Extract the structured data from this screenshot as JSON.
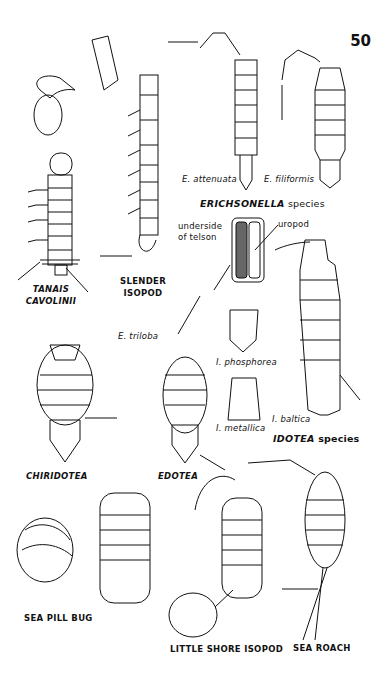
{
  "page_number": "50",
  "groups": {
    "erichsonella": {
      "title_genus": "ERICHSONELLA",
      "title_suffix": " species",
      "species": [
        {
          "name": "E. attenuata"
        },
        {
          "name": "E. filiformis"
        }
      ],
      "detail_labels": {
        "underside_line1": "underside",
        "underside_line2": "of telson",
        "uropod": "uropod"
      }
    },
    "idotea": {
      "title_genus": "IDOTEA",
      "title_suffix": " species",
      "species": [
        {
          "name": "I. phosphorea"
        },
        {
          "name": "I. metallica"
        },
        {
          "name": "I. baltica"
        }
      ]
    },
    "edotea": {
      "species_label": "E. triloba"
    }
  },
  "animals": [
    {
      "id": "tanais",
      "label_line1": "TANAIS",
      "label_line2": "CAVOLINII",
      "italic": true
    },
    {
      "id": "slender-isopod",
      "label_line1": "SLENDER",
      "label_line2": "ISOPOD"
    },
    {
      "id": "chiridotea",
      "label": "CHIRIDOTEA",
      "italic": true
    },
    {
      "id": "edotea",
      "label": "EDOTEA",
      "italic": true
    },
    {
      "id": "sea-pill-bug",
      "label": "SEA PILL BUG"
    },
    {
      "id": "little-shore-isopod",
      "label": "LITTLE SHORE ISOPOD"
    },
    {
      "id": "sea-roach",
      "label": "SEA ROACH"
    }
  ]
}
